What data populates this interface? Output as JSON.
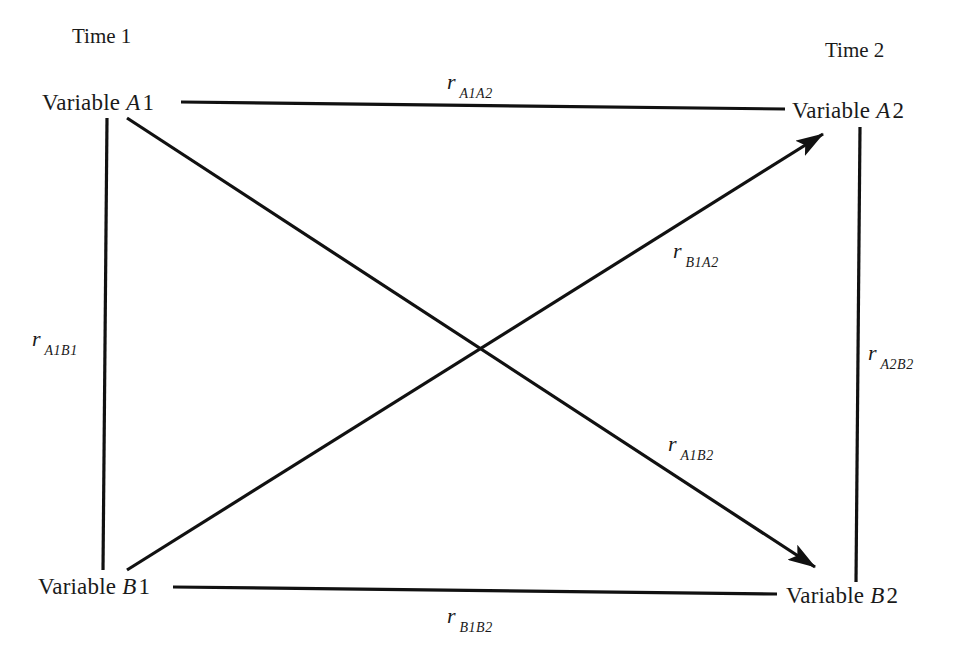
{
  "diagram": {
    "type": "cross-lagged panel correlation",
    "time_labels": {
      "time1": "Time 1",
      "time2": "Time 2"
    },
    "nodes": {
      "A1": {
        "prefix": "Variable ",
        "name": "A1",
        "letter": "A",
        "index": "1",
        "time": "Time 1"
      },
      "A2": {
        "prefix": "Variable ",
        "name": "A2",
        "letter": "A",
        "index": "2",
        "time": "Time 2"
      },
      "B1": {
        "prefix": "Variable ",
        "name": "B1",
        "letter": "B",
        "index": "1",
        "time": "Time 1"
      },
      "B2": {
        "prefix": "Variable ",
        "name": "B2",
        "letter": "B",
        "index": "2",
        "time": "Time 2"
      }
    },
    "edges": [
      {
        "id": "rA1A2",
        "from": "A1",
        "to": "A2",
        "kind": "autocorrelation",
        "directed": false,
        "symbol": "r",
        "subscript": "A1A2"
      },
      {
        "id": "rB1B2",
        "from": "B1",
        "to": "B2",
        "kind": "autocorrelation",
        "directed": false,
        "symbol": "r",
        "subscript": "B1B2"
      },
      {
        "id": "rA1B1",
        "from": "A1",
        "to": "B1",
        "kind": "synchronous",
        "directed": false,
        "symbol": "r",
        "subscript": "A1B1"
      },
      {
        "id": "rA2B2",
        "from": "A2",
        "to": "B2",
        "kind": "synchronous",
        "directed": false,
        "symbol": "r",
        "subscript": "A2B2"
      },
      {
        "id": "rB1A2",
        "from": "B1",
        "to": "A2",
        "kind": "cross-lagged",
        "directed": true,
        "symbol": "r",
        "subscript": "B1A2"
      },
      {
        "id": "rA1B2",
        "from": "A1",
        "to": "B2",
        "kind": "cross-lagged",
        "directed": true,
        "symbol": "r",
        "subscript": "A1B2"
      }
    ],
    "colors": {
      "stroke": "#111111",
      "text": "#1a1a1a",
      "background": "#ffffff"
    }
  }
}
